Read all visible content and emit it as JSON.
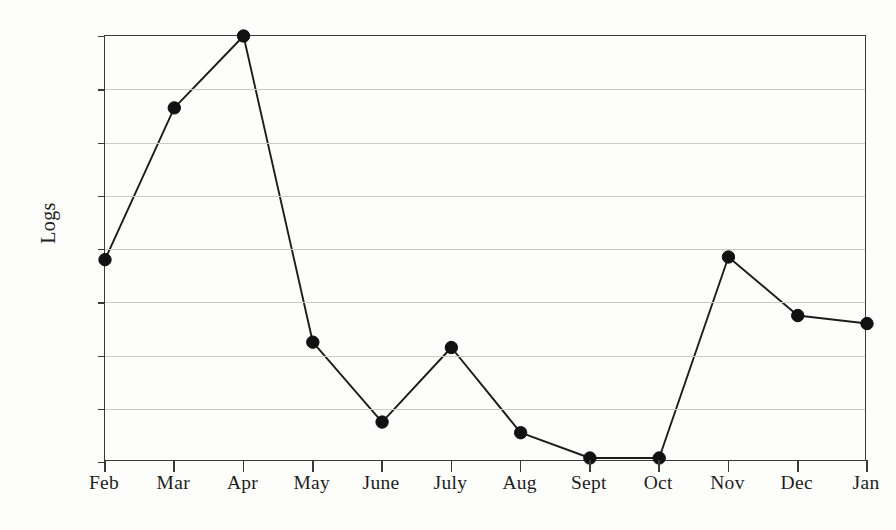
{
  "chart_data": {
    "type": "line",
    "title": "",
    "xlabel": "",
    "ylabel": "Logs",
    "categories": [
      "Feb",
      "Mar",
      "Apr",
      "May",
      "June",
      "July",
      "Aug",
      "Sept",
      "Oct",
      "Nov",
      "Dec",
      "Jan"
    ],
    "values": [
      76,
      133,
      160,
      45,
      15,
      43,
      11,
      1.5,
      1.5,
      77,
      55,
      52
    ],
    "series": [
      {
        "name": "Logs",
        "values": [
          76,
          133,
          160,
          45,
          15,
          43,
          11,
          1.5,
          1.5,
          77,
          55,
          52
        ]
      }
    ],
    "ylim": [
      0,
      160
    ],
    "yticks": [
      0,
      20,
      40,
      60,
      80,
      100,
      120,
      140,
      160
    ],
    "ytick_labels": [
      "0",
      "20",
      "40",
      "60",
      "80",
      "100",
      "120",
      "140",
      "160"
    ],
    "grid": true,
    "legend": false,
    "marker": "filled-circle",
    "line_color": "#1c1c1c",
    "marker_color": "#111111",
    "grid_color": "#c9c9c9",
    "axis_color": "#3a3a3a",
    "background": "#fdfdfc"
  }
}
